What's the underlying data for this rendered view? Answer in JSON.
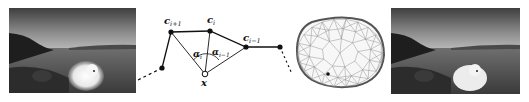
{
  "figure": {
    "panels": [
      {
        "id": "input-photo",
        "description": "grayscale photo of polar bear on a rocky beach at dusk"
      },
      {
        "id": "coordinate-diagram",
        "description": "mean value coordinates construction"
      },
      {
        "id": "triangulated-mesh",
        "description": "triangulated membrane mesh of blob region"
      },
      {
        "id": "output-photo",
        "description": "grayscale photo of polar bear cloned onto beach"
      }
    ],
    "diagram": {
      "labels": {
        "c_next": "c",
        "c_next_sub": "i+1",
        "c_cur": "c",
        "c_cur_sub": "i",
        "c_prev": "c",
        "c_prev_sub": "i−1",
        "alpha_i": "α",
        "alpha_i_sub": "i",
        "alpha_prev": "α",
        "alpha_prev_sub": "i−1",
        "x": "x"
      }
    },
    "colors": {
      "ink": "#111111",
      "photo_sky": "#6e6e6e",
      "photo_water": "#5a5a5a",
      "bear": "#f2f2f2"
    }
  }
}
